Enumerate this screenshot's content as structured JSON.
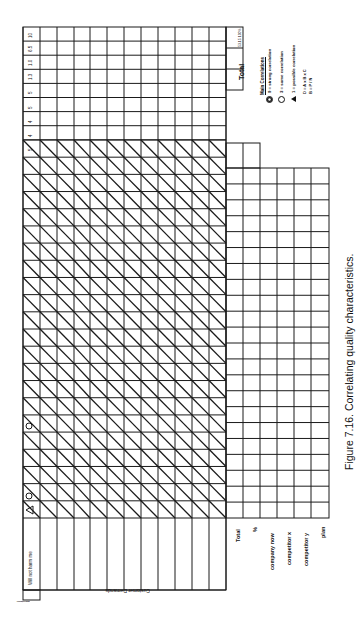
{
  "figure": {
    "caption": "Figure 7.16.  Correlating quality characteristics.",
    "orientation": "rotated 90° counter-clockwise"
  },
  "matrix": {
    "corner_label": "Importance",
    "row_header_title": "Customer Demands",
    "first_demand": "Will not harm me",
    "demand_rows": 11,
    "characteristic_columns": 22,
    "importance_values": [
      "10",
      "6.5",
      "1.0",
      "1.3",
      "5",
      "5",
      "4",
      "4",
      "5"
    ],
    "totals_box": {
      "label": "Total",
      "value": "53.15 100%"
    },
    "symbols_in_first_row": [
      {
        "column": 1,
        "symbol": "triangle",
        "meaning": "possible correlation"
      },
      {
        "column": 2,
        "symbol": "circle",
        "meaning": "some correlation"
      },
      {
        "column": 5,
        "symbol": "circle",
        "meaning": "some correlation"
      }
    ]
  },
  "bottom_rows": {
    "labels": [
      "Total",
      "%",
      "company now",
      "competitor x",
      "competitor y",
      "plan"
    ]
  },
  "legend": {
    "title": "Main Correlations",
    "items": [
      {
        "icon": "double-circle",
        "text": "9 = strong correlation"
      },
      {
        "icon": "circle",
        "text": "3 = some correlation"
      },
      {
        "icon": "triangle",
        "text": "1 = possible correlation"
      }
    ],
    "formula_1": "D = A x B x C",
    "formula_2": "B = P / N"
  }
}
